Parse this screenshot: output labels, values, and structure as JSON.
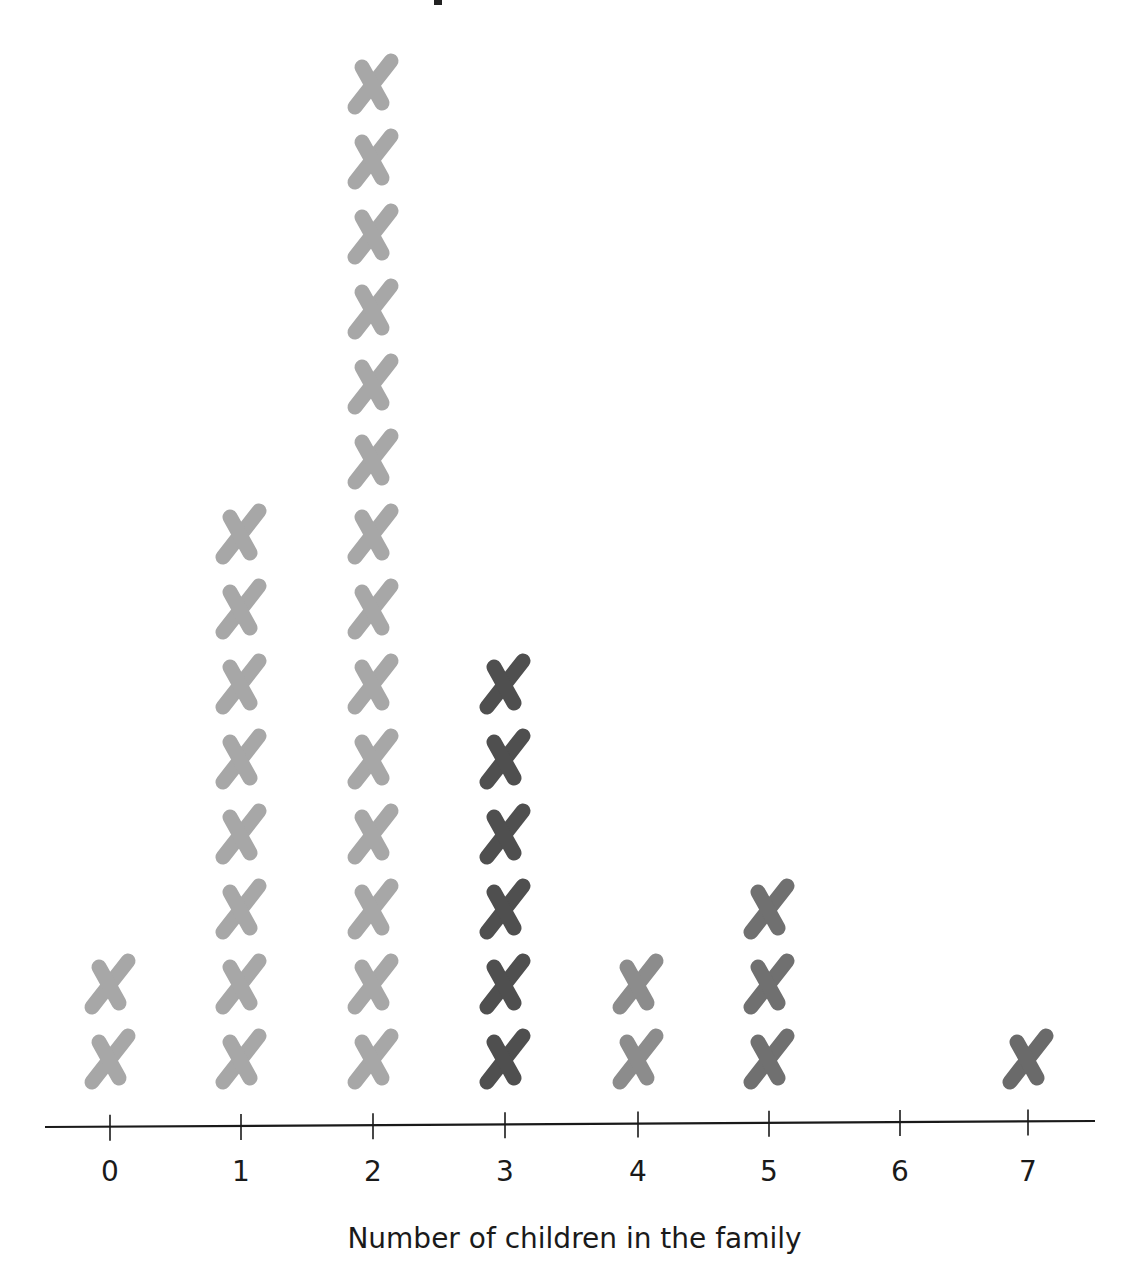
{
  "chart_data": {
    "type": "dot_plot",
    "title": "",
    "xlabel": "Number of children in the family",
    "ylabel": "",
    "categories": [
      "0",
      "1",
      "2",
      "3",
      "4",
      "5",
      "6",
      "7"
    ],
    "values": [
      2,
      8,
      14,
      6,
      2,
      3,
      0,
      1
    ],
    "marker": "x",
    "marker_colors": [
      "#a7a7a7",
      "#a7a7a7",
      "#a7a7a7",
      "#4f4f4f",
      "#8c8c8c",
      "#707070",
      "#707070",
      "#6a6a6a"
    ],
    "xlim": [
      0,
      7
    ],
    "grid": false,
    "legend": null
  },
  "axis": {
    "tick_labels": [
      "0",
      "1",
      "2",
      "3",
      "4",
      "5",
      "6",
      "7"
    ],
    "xlabel": "Number of children in the family"
  }
}
